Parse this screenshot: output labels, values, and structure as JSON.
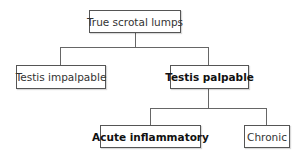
{
  "diagram": {
    "root": {
      "label": "True scrotal lumps"
    },
    "level1": [
      {
        "label": "Testis impalpable",
        "bold": false
      },
      {
        "label": "Testis palpable",
        "bold": true
      }
    ],
    "level2": [
      {
        "label": "Acute inflammatory",
        "bold": true
      },
      {
        "label": "Chronic",
        "bold": false
      }
    ]
  }
}
